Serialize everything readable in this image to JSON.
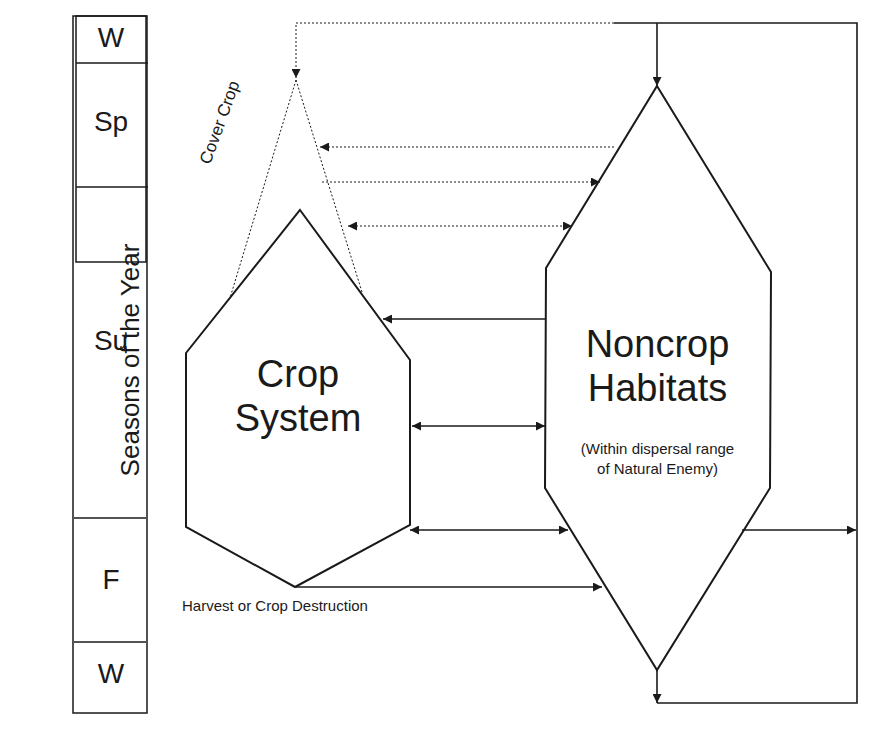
{
  "axis_title": "Seasons of the Year",
  "seasons": [
    {
      "label": "W"
    },
    {
      "label": "Sp"
    },
    {
      "label": "Su"
    },
    {
      "label": "F"
    },
    {
      "label": "W"
    }
  ],
  "nodes": {
    "crop_system": {
      "line1": "Crop",
      "line2": "System"
    },
    "noncrop": {
      "line1": "Noncrop",
      "line2": "Habitats",
      "note1": "(Within dispersal range",
      "note2": "of Natural Enemy)"
    },
    "cover_crop": {
      "label": "Cover Crop"
    }
  },
  "annotations": {
    "harvest": "Harvest or Crop Destruction"
  },
  "colors": {
    "stroke": "#1a1a1a",
    "background": "#ffffff"
  }
}
